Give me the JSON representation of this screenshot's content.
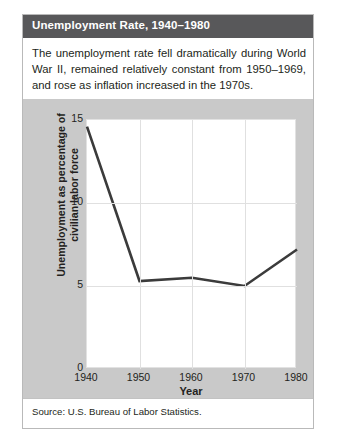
{
  "figure": {
    "title": "Unemployment Rate, 1940–1980",
    "description": "The unemployment rate fell dramatically during World War II, remained relatively constant from 1950–1969, and rose as inflation increased in the 1970s.",
    "source": "Source: U.S. Bureau of Labor Statistics.",
    "title_bar_color": "#58585a",
    "chart_background_color": "#c9c9c9",
    "plot_background_color": "#ffffff",
    "line_color": "#3b3b3b",
    "grid_color": "#e0e0e0"
  },
  "chart_data": {
    "type": "line",
    "title": "Unemployment Rate, 1940–1980",
    "subtitle": "",
    "xlabel": "Year",
    "ylabel": "Unemployment as percentage of civilian labor force",
    "x": [
      1940,
      1950,
      1960,
      1970,
      1980
    ],
    "values": [
      14.6,
      5.3,
      5.5,
      5.0,
      7.2
    ],
    "series": [
      {
        "name": "Unemployment as percentage of civilian labor force",
        "values": [
          14.6,
          5.3,
          5.5,
          5.0,
          7.2
        ]
      }
    ],
    "xlim": [
      1940,
      1980
    ],
    "ylim": [
      0,
      15
    ],
    "xticks": [
      1940,
      1950,
      1960,
      1970,
      1980
    ],
    "xtick_labels": [
      "1940",
      "1950",
      "1960",
      "1970",
      "1980"
    ],
    "yticks": [
      0,
      5,
      10,
      15
    ],
    "ytick_labels": [
      "0",
      "5",
      "10",
      "15"
    ],
    "grid": "horizontal gridlines at 5 and 10; vertical gridlines at 1950, 1960, 1970",
    "legend": "none",
    "legend_position": "none",
    "annotations": []
  }
}
